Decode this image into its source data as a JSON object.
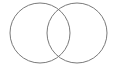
{
  "diagram": {
    "type": "venn",
    "stroke_color": "#7a7a7a",
    "background": "#ffffff",
    "circles": [
      {
        "name": "left-circle",
        "cx": 40,
        "cy": 33,
        "r": 30
      },
      {
        "name": "right-circle",
        "cx": 77,
        "cy": 33,
        "r": 30
      }
    ]
  }
}
